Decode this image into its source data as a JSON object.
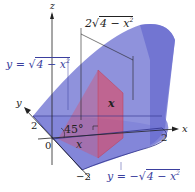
{
  "diagram": {
    "type": "3d-solid-cross-section",
    "colors": {
      "solid": "#7b7fd6",
      "solid_edge": "#2e318a",
      "cross_section": "#e0485f",
      "axis": "#222222",
      "label_blue": "#3b3f9e"
    },
    "axes": {
      "x_label": "x",
      "y_label": "y",
      "z_label": "z"
    },
    "ticks": {
      "y_pos": "2",
      "y_neg": "−2",
      "x_pos": "2",
      "origin": "0"
    },
    "labels": {
      "top_curve_prefix": "y = ",
      "top_curve_radical": "4 − x",
      "top_curve_exp": "2",
      "bottom_curve_prefix": "y = −",
      "bottom_curve_radical": "4 − x",
      "bottom_curve_exp": "2",
      "width_coef": "2",
      "width_radical": "4 − x",
      "width_exp": "2",
      "height": "x",
      "base_x": "x",
      "angle": "45°"
    }
  }
}
